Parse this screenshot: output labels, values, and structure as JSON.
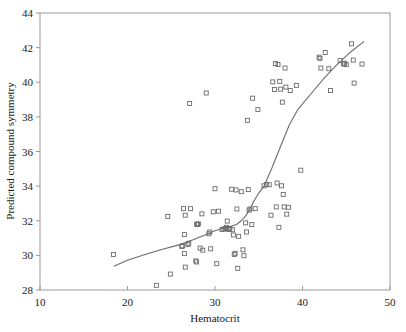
{
  "chart_data": {
    "type": "scatter",
    "title": "",
    "xlabel": "Hematocrit",
    "ylabel": "Predicted compound symmetry",
    "xlim": [
      10,
      50
    ],
    "ylim": [
      28,
      44
    ],
    "xticks": [
      10,
      20,
      30,
      40,
      50
    ],
    "yticks": [
      28,
      30,
      32,
      34,
      36,
      38,
      40,
      42,
      44
    ],
    "grid": false,
    "legend": null,
    "marker": {
      "shape": "open-square",
      "size_px": 4,
      "color": "#6b6b6b",
      "fill": "none"
    },
    "points": [
      [
        18.4,
        30.05
      ],
      [
        23.3,
        28.27
      ],
      [
        24.6,
        32.25
      ],
      [
        24.9,
        28.92
      ],
      [
        26.2,
        30.52
      ],
      [
        26.3,
        30.55
      ],
      [
        26.4,
        32.7
      ],
      [
        26.5,
        31.2
      ],
      [
        26.5,
        30.1
      ],
      [
        26.6,
        32.32
      ],
      [
        26.6,
        29.32
      ],
      [
        26.9,
        30.62
      ],
      [
        27.0,
        30.7
      ],
      [
        27.1,
        38.77
      ],
      [
        27.2,
        32.7
      ],
      [
        27.8,
        29.68
      ],
      [
        27.9,
        29.62
      ],
      [
        27.9,
        31.8
      ],
      [
        28.0,
        31.78
      ],
      [
        28.1,
        31.82
      ],
      [
        28.3,
        30.42
      ],
      [
        28.5,
        32.4
      ],
      [
        28.6,
        30.3
      ],
      [
        29.0,
        39.38
      ],
      [
        29.3,
        31.25
      ],
      [
        29.4,
        31.35
      ],
      [
        29.5,
        30.38
      ],
      [
        29.8,
        32.52
      ],
      [
        30.0,
        33.85
      ],
      [
        30.2,
        29.52
      ],
      [
        30.4,
        32.55
      ],
      [
        30.8,
        31.5
      ],
      [
        31.0,
        31.52
      ],
      [
        31.2,
        31.55
      ],
      [
        31.3,
        31.62
      ],
      [
        31.4,
        31.98
      ],
      [
        31.5,
        31.52
      ],
      [
        31.6,
        31.5
      ],
      [
        31.7,
        31.55
      ],
      [
        31.9,
        33.82
      ],
      [
        32.0,
        31.48
      ],
      [
        32.1,
        31.18
      ],
      [
        32.2,
        30.05
      ],
      [
        32.3,
        30.12
      ],
      [
        32.4,
        33.78
      ],
      [
        32.5,
        32.68
      ],
      [
        32.6,
        29.25
      ],
      [
        32.7,
        31.1
      ],
      [
        33.0,
        33.68
      ],
      [
        33.2,
        30.32
      ],
      [
        33.3,
        29.98
      ],
      [
        33.5,
        31.88
      ],
      [
        33.6,
        31.35
      ],
      [
        33.7,
        37.8
      ],
      [
        33.8,
        33.8
      ],
      [
        33.9,
        32.62
      ],
      [
        34.0,
        32.68
      ],
      [
        34.2,
        31.78
      ],
      [
        34.3,
        39.08
      ],
      [
        34.6,
        32.7
      ],
      [
        34.9,
        38.42
      ],
      [
        35.6,
        34.02
      ],
      [
        35.9,
        34.1
      ],
      [
        36.2,
        34.08
      ],
      [
        36.4,
        32.32
      ],
      [
        36.6,
        40.02
      ],
      [
        36.8,
        39.58
      ],
      [
        36.9,
        41.08
      ],
      [
        37.0,
        32.8
      ],
      [
        37.1,
        34.18
      ],
      [
        37.2,
        41.02
      ],
      [
        37.3,
        31.62
      ],
      [
        37.4,
        40.05
      ],
      [
        37.5,
        39.6
      ],
      [
        37.6,
        34.02
      ],
      [
        37.7,
        38.85
      ],
      [
        37.8,
        33.52
      ],
      [
        37.9,
        32.8
      ],
      [
        38.0,
        40.82
      ],
      [
        38.1,
        39.72
      ],
      [
        38.2,
        32.38
      ],
      [
        38.4,
        32.78
      ],
      [
        38.6,
        39.52
      ],
      [
        39.3,
        39.82
      ],
      [
        39.8,
        34.92
      ],
      [
        41.9,
        41.45
      ],
      [
        42.0,
        41.38
      ],
      [
        42.1,
        40.82
      ],
      [
        42.6,
        41.72
      ],
      [
        43.0,
        40.78
      ],
      [
        43.2,
        39.52
      ],
      [
        44.3,
        41.25
      ],
      [
        44.7,
        41.05
      ],
      [
        44.8,
        41.1
      ],
      [
        45.0,
        41.02
      ],
      [
        45.6,
        42.22
      ],
      [
        45.8,
        41.28
      ],
      [
        45.9,
        39.95
      ],
      [
        46.8,
        41.05
      ]
    ],
    "fit_curve": {
      "name": "smoothed-fit-line",
      "color": "#6b6b6b",
      "points": [
        [
          18.5,
          29.38
        ],
        [
          20.0,
          29.72
        ],
        [
          22.0,
          30.05
        ],
        [
          24.0,
          30.35
        ],
        [
          26.0,
          30.62
        ],
        [
          27.5,
          30.9
        ],
        [
          29.0,
          31.2
        ],
        [
          30.0,
          31.42
        ],
        [
          31.0,
          31.58
        ],
        [
          31.8,
          31.68
        ],
        [
          32.5,
          31.8
        ],
        [
          33.0,
          32.0
        ],
        [
          33.5,
          32.28
        ],
        [
          34.0,
          32.68
        ],
        [
          34.5,
          33.18
        ],
        [
          35.0,
          33.6
        ],
        [
          35.6,
          34.0
        ],
        [
          36.5,
          35.05
        ],
        [
          37.5,
          36.3
        ],
        [
          38.5,
          37.55
        ],
        [
          39.5,
          38.45
        ],
        [
          41.0,
          39.35
        ],
        [
          42.5,
          40.25
        ],
        [
          44.0,
          41.05
        ],
        [
          45.5,
          41.75
        ],
        [
          47.0,
          42.35
        ]
      ]
    }
  }
}
